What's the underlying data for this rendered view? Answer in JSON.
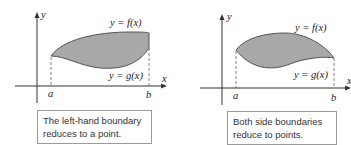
{
  "figures": [
    {
      "id": "left",
      "labels": {
        "y_axis": "y",
        "x_axis": "x",
        "upper_curve": "y = f(x)",
        "lower_curve": "y = g(x)",
        "a": "a",
        "b": "b"
      },
      "caption": {
        "line1": "The left-hand boundary",
        "line2": "reduces to a point."
      },
      "fill_color": "#a8a8a8",
      "stroke_color": "#555555"
    },
    {
      "id": "right",
      "labels": {
        "y_axis": "y",
        "x_axis": "x",
        "upper_curve": "y = f(x)",
        "lower_curve": "y = g(x)",
        "a": "a",
        "b": "b"
      },
      "caption": {
        "line1": "Both side boundaries",
        "line2": "reduce to points."
      },
      "fill_color": "#a8a8a8",
      "stroke_color": "#555555"
    }
  ]
}
